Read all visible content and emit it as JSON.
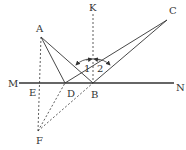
{
  "diagram": {
    "type": "geometry-reflection",
    "points": {
      "A": {
        "label": "A",
        "x": 41,
        "y": 37,
        "lx": 36,
        "ly": 32
      },
      "K": {
        "label": "K",
        "x": 93,
        "y": 14,
        "lx": 89,
        "ly": 11
      },
      "C": {
        "label": "C",
        "x": 167,
        "y": 20,
        "lx": 169,
        "ly": 14
      },
      "M": {
        "label": "M",
        "x": 19,
        "y": 83,
        "lx": 8,
        "ly": 87
      },
      "N": {
        "label": "N",
        "x": 174,
        "y": 83,
        "lx": 176,
        "ly": 91
      },
      "E": {
        "label": "E",
        "x": 40,
        "y": 83,
        "lx": 29,
        "ly": 96
      },
      "D": {
        "label": "D",
        "x": 65,
        "y": 83,
        "lx": 67,
        "ly": 97
      },
      "B": {
        "label": "B",
        "x": 93,
        "y": 83,
        "lx": 91,
        "ly": 98
      },
      "F": {
        "label": "F",
        "x": 38,
        "y": 131,
        "lx": 36,
        "ly": 144
      }
    },
    "angles": [
      {
        "label": "1",
        "x": 84,
        "y": 72
      },
      {
        "label": "2",
        "x": 97,
        "y": 72
      }
    ],
    "colors": {
      "stroke": "#333333",
      "background": "#ffffff"
    }
  }
}
